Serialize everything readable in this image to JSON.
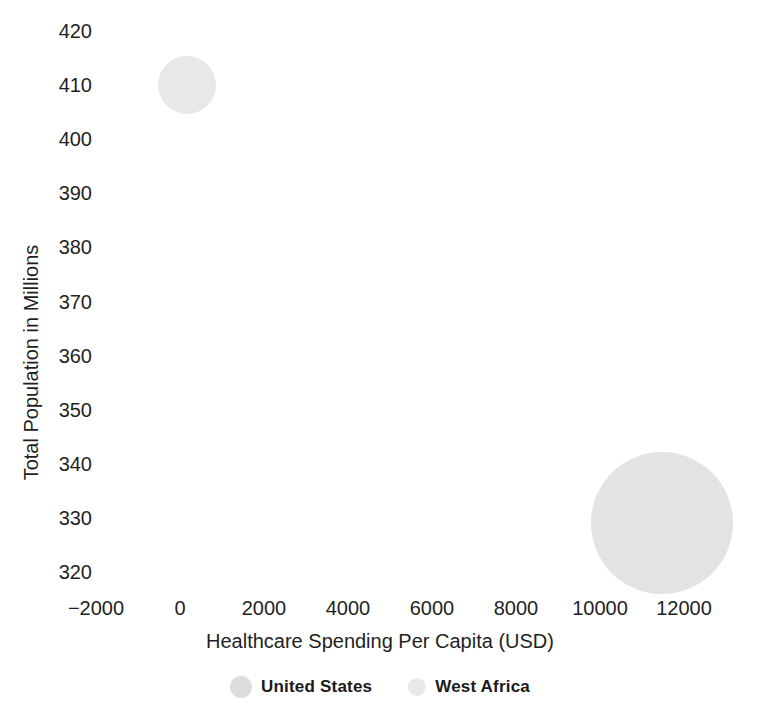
{
  "chart_data": {
    "type": "scatter",
    "subtype": "bubble",
    "title": "",
    "xlabel": "Healthcare Spending Per Capita (USD)",
    "ylabel": "Total Population in Millions",
    "xlim": [
      -2800,
      13800
    ],
    "ylim": [
      317.5,
      422.5
    ],
    "xticks": [
      "-2000",
      "0",
      "2000",
      "4000",
      "6000",
      "8000",
      "10000",
      "12000"
    ],
    "xtick_values": [
      -2000,
      0,
      2000,
      4000,
      6000,
      8000,
      10000,
      12000
    ],
    "yticks": [
      "420",
      "410",
      "400",
      "390",
      "380",
      "370",
      "360",
      "350",
      "340",
      "330",
      "320"
    ],
    "ytick_values": [
      420,
      410,
      400,
      390,
      380,
      370,
      360,
      350,
      340,
      330,
      320
    ],
    "grid": false,
    "axis_lines": false,
    "legend_position": "bottom",
    "background_color": "#ffffff",
    "points": [
      {
        "name": "West Africa",
        "x": 170,
        "y": 410,
        "radius_px": 29,
        "color": "#e8e8e8"
      },
      {
        "name": "United States",
        "x": 11470,
        "y": 329,
        "radius_px": 71,
        "color": "#e3e3e3"
      }
    ],
    "series": [
      {
        "name": "United States",
        "x": [
          11470
        ],
        "y": [
          329
        ],
        "color": "#dddddd",
        "legend_marker_radius_px": 11
      },
      {
        "name": "West Africa",
        "x": [
          170
        ],
        "y": [
          410
        ],
        "color": "#e8e8e8",
        "legend_marker_radius_px": 9
      }
    ]
  },
  "legend": {
    "entries": [
      {
        "label": "United States",
        "color": "#dddddd"
      },
      {
        "label": "West Africa",
        "color": "#e9e9e9"
      }
    ]
  }
}
